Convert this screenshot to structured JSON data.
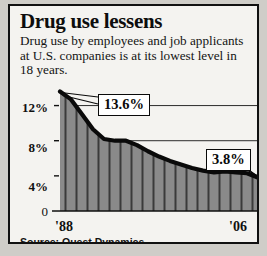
{
  "headline": "Drug use lessens",
  "subhead": "Drug use by employees and job applicants at U.S. companies is at its lowest level in 18 years.",
  "source": "Source: Quest Dynamics",
  "axis": {
    "y_ticks": [
      "12%",
      "8%",
      "4%"
    ],
    "zero_label": "0",
    "x_start": "'88",
    "x_end": "'06"
  },
  "callouts": {
    "start": "13.6%",
    "end": "3.8%"
  },
  "colors": {
    "frame": "#111111",
    "panel": "#f4f3f0",
    "area_fill": "#8a8a8a",
    "area_rule": "#3a3a3a",
    "line": "#0a0a0a",
    "gridline": "#2b2b2b",
    "page": "#cfcdc8"
  },
  "chart_data": {
    "type": "area",
    "title": "Drug use lessens",
    "subtitle": "Drug use by employees and job applicants at U.S. companies is at its lowest level in 18 years.",
    "xlabel": "",
    "ylabel": "Percent of workers testing positive",
    "ylim": [
      0,
      14
    ],
    "yticks": [
      4,
      8,
      12
    ],
    "ytick_labels": [
      "4%",
      "8%",
      "12%"
    ],
    "grid": true,
    "legend": null,
    "source": "Source: Quest Dynamics",
    "annotations": [
      {
        "label": "13.6%",
        "x": "'88",
        "value": 13.6
      },
      {
        "label": "3.8%",
        "x": "'06",
        "value": 3.8
      }
    ],
    "categories": [
      "'88",
      "'89",
      "'90",
      "'91",
      "'92",
      "'93",
      "'94",
      "'95",
      "'96",
      "'97",
      "'98",
      "'99",
      "'00",
      "'01",
      "'02",
      "'03",
      "'04",
      "'05",
      "'06"
    ],
    "values": [
      13.6,
      12.7,
      11.0,
      9.3,
      8.2,
      8.0,
      8.0,
      7.5,
      6.8,
      6.2,
      5.7,
      5.3,
      4.9,
      4.6,
      4.4,
      4.5,
      4.4,
      4.3,
      3.8
    ],
    "series": [
      {
        "name": "Percent testing positive",
        "values": [
          13.6,
          12.7,
          11.0,
          9.3,
          8.2,
          8.0,
          8.0,
          7.5,
          6.8,
          6.2,
          5.7,
          5.3,
          4.9,
          4.6,
          4.4,
          4.5,
          4.4,
          4.3,
          3.8
        ]
      }
    ]
  }
}
